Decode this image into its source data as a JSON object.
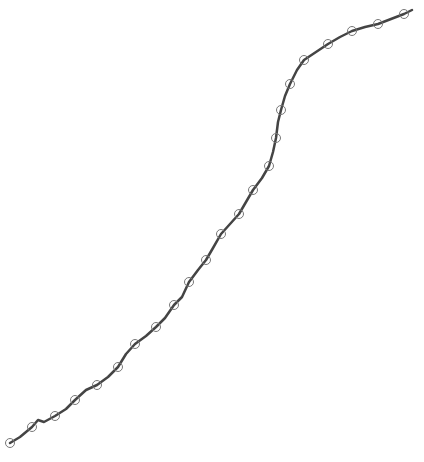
{
  "chart_data": {
    "type": "line",
    "title": "",
    "xlabel": "",
    "ylabel": "",
    "grid": false,
    "legend": null,
    "axes_visible": false,
    "series": [
      {
        "name": "series-1",
        "color": "#444444",
        "marker": "open-circle",
        "marker_color": "#777777",
        "line_width": 2.5,
        "points": [
          [
            10,
            443
          ],
          [
            32,
            427
          ],
          [
            55,
            416
          ],
          [
            75,
            400
          ],
          [
            97,
            385
          ],
          [
            118,
            367
          ],
          [
            135,
            344
          ],
          [
            156,
            327
          ],
          [
            174,
            305
          ],
          [
            189,
            282
          ],
          [
            206,
            260
          ],
          [
            221,
            234
          ],
          [
            239,
            214
          ],
          [
            253,
            190
          ],
          [
            269,
            166
          ],
          [
            276,
            138
          ],
          [
            281,
            110
          ],
          [
            290,
            84
          ],
          [
            304,
            60
          ],
          [
            328,
            44
          ],
          [
            352,
            31
          ],
          [
            378,
            24
          ],
          [
            404,
            14
          ]
        ],
        "path": [
          [
            10,
            443
          ],
          [
            20,
            437
          ],
          [
            32,
            427
          ],
          [
            38,
            420
          ],
          [
            44,
            422
          ],
          [
            55,
            416
          ],
          [
            66,
            409
          ],
          [
            75,
            400
          ],
          [
            86,
            390
          ],
          [
            97,
            385
          ],
          [
            108,
            377
          ],
          [
            118,
            367
          ],
          [
            126,
            354
          ],
          [
            135,
            344
          ],
          [
            146,
            336
          ],
          [
            156,
            327
          ],
          [
            165,
            318
          ],
          [
            174,
            305
          ],
          [
            182,
            297
          ],
          [
            189,
            282
          ],
          [
            198,
            270
          ],
          [
            206,
            260
          ],
          [
            213,
            248
          ],
          [
            221,
            234
          ],
          [
            230,
            224
          ],
          [
            239,
            214
          ],
          [
            246,
            202
          ],
          [
            253,
            190
          ],
          [
            262,
            178
          ],
          [
            269,
            166
          ],
          [
            273,
            152
          ],
          [
            276,
            138
          ],
          [
            278,
            122
          ],
          [
            281,
            110
          ],
          [
            285,
            96
          ],
          [
            290,
            84
          ],
          [
            297,
            70
          ],
          [
            304,
            60
          ],
          [
            316,
            52
          ],
          [
            328,
            44
          ],
          [
            340,
            37
          ],
          [
            352,
            31
          ],
          [
            365,
            27
          ],
          [
            378,
            24
          ],
          [
            391,
            19
          ],
          [
            404,
            14
          ],
          [
            412,
            10
          ]
        ]
      }
    ],
    "coordinate_note": "values are pixel positions in the 424x462 canvas (no axes shown)"
  }
}
